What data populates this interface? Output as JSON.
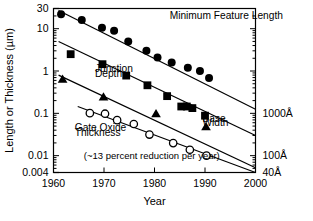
{
  "chart_data": {
    "type": "line",
    "title": "",
    "xlabel": "Year",
    "ylabel": "Length or Thickness (µm)",
    "ylabel_right": "",
    "xlim": [
      1960,
      2000
    ],
    "ylim": [
      0.004,
      30
    ],
    "yscale": "log",
    "grid": false,
    "legend_position": "inline-annotations",
    "xticks": [
      "1960",
      "1970",
      "1980",
      "1990",
      "2000"
    ],
    "xtick_values": [
      1960,
      1970,
      1980,
      1990,
      2000
    ],
    "yticks": [
      "30",
      "10",
      "1",
      "0.1",
      "0.01",
      "0.004"
    ],
    "ytick_values": [
      30,
      10,
      1,
      0.1,
      0.01,
      0.004
    ],
    "yticks_right": [
      "1000Å",
      "100Å",
      "40Å"
    ],
    "ytick_right_values": [
      0.1,
      0.01,
      0.004
    ],
    "annotations": [
      {
        "text": "Minimum Feature Length",
        "x": 1983,
        "y": 17.0
      },
      {
        "text": "Junction",
        "x": 1968.2,
        "y": 0.93
      },
      {
        "text": "Depth",
        "x": 1968.2,
        "y": 0.72
      },
      {
        "text": "Gate Oxide",
        "x": 1964.2,
        "y": 0.0385
      },
      {
        "text": "Thickness",
        "x": 1964.2,
        "y": 0.0298
      },
      {
        "text": "Base",
        "x": 1989.5,
        "y": 0.063
      },
      {
        "text": "Width",
        "x": 1989.5,
        "y": 0.049
      },
      {
        "text": "(~13 percent reduction per year)",
        "x": 1966.0,
        "y": 0.0082
      }
    ],
    "series": [
      {
        "name": "Minimum Feature Length",
        "marker": "filled-circle",
        "color": "#000000",
        "fit_line": {
          "x": [
            1961.0,
            2000.0
          ],
          "y": [
            27.0,
            0.125
          ]
        },
        "points": [
          {
            "x": 1961.5,
            "y": 22.0
          },
          {
            "x": 1965.6,
            "y": 16.0
          },
          {
            "x": 1969.6,
            "y": 10.5
          },
          {
            "x": 1972.0,
            "y": 9.0
          },
          {
            "x": 1974.8,
            "y": 5.0
          },
          {
            "x": 1978.4,
            "y": 3.0
          },
          {
            "x": 1980.6,
            "y": 2.1
          },
          {
            "x": 1983.4,
            "y": 1.6
          },
          {
            "x": 1986.6,
            "y": 1.2
          },
          {
            "x": 1989.0,
            "y": 1.0
          },
          {
            "x": 1990.8,
            "y": 0.68
          }
        ]
      },
      {
        "name": "Junction Depth",
        "marker": "filled-square",
        "color": "#000000",
        "fit_line": {
          "x": [
            1961.0,
            2000.0
          ],
          "y": [
            5.0,
            0.03
          ]
        },
        "points": [
          {
            "x": 1963.4,
            "y": 2.5
          },
          {
            "x": 1969.7,
            "y": 1.45
          },
          {
            "x": 1974.4,
            "y": 0.78
          },
          {
            "x": 1978.6,
            "y": 0.46
          },
          {
            "x": 1982.5,
            "y": 0.255
          },
          {
            "x": 1985.3,
            "y": 0.145
          },
          {
            "x": 1986.4,
            "y": 0.145
          },
          {
            "x": 1987.5,
            "y": 0.133
          },
          {
            "x": 1990.0,
            "y": 0.088
          }
        ]
      },
      {
        "name": "Base Width",
        "marker": "filled-triangle",
        "color": "#000000",
        "fit_line": {
          "x": [
            1961.0,
            2000.0
          ],
          "y": [
            0.8,
            0.0052
          ]
        },
        "points": [
          {
            "x": 1961.8,
            "y": 0.64
          },
          {
            "x": 1969.9,
            "y": 0.245
          },
          {
            "x": 1980.3,
            "y": 0.098
          },
          {
            "x": 1990.2,
            "y": 0.0485
          }
        ]
      },
      {
        "name": "Gate Oxide Thickness",
        "marker": "open-circle",
        "color": "#000000",
        "fit_line": {
          "x": [
            1964.8,
            2000.0
          ],
          "y": [
            0.145,
            0.004
          ]
        },
        "points": [
          {
            "x": 1967.2,
            "y": 0.101
          },
          {
            "x": 1970.2,
            "y": 0.098
          },
          {
            "x": 1972.6,
            "y": 0.069
          },
          {
            "x": 1975.9,
            "y": 0.056
          },
          {
            "x": 1979.0,
            "y": 0.0315
          },
          {
            "x": 1983.7,
            "y": 0.0198
          },
          {
            "x": 1987.0,
            "y": 0.0138
          },
          {
            "x": 1990.3,
            "y": 0.01
          }
        ]
      }
    ]
  }
}
